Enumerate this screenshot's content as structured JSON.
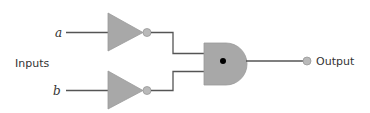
{
  "diagram": {
    "type": "logic-circuit",
    "inputs_label": "Inputs",
    "inputs": [
      {
        "id": "a",
        "label": "a"
      },
      {
        "id": "b",
        "label": "b"
      }
    ],
    "gates": [
      {
        "id": "not-a",
        "type": "NOT",
        "input": "a"
      },
      {
        "id": "not-b",
        "type": "NOT",
        "input": "b"
      },
      {
        "id": "and-1",
        "type": "AND",
        "inputs": [
          "not-a",
          "not-b"
        ]
      }
    ],
    "output": {
      "label": "Output",
      "source": "and-1"
    },
    "colors": {
      "gate_fill": "#a8a8a8",
      "bubble_fill": "#b9b9b9",
      "wire": "#555555",
      "text": "#333333",
      "and_dot": "#000000"
    }
  }
}
